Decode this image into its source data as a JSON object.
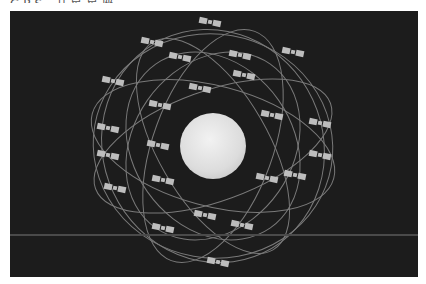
{
  "header": {
    "text": "GPS 卫星星座"
  },
  "scene": {
    "description": "GPS satellite constellation orbiting Earth",
    "background_color": "#1c1c1c",
    "orbit_color": "#8a8a8a",
    "satellite_color": "#bdbdbd",
    "globe": {
      "cx": 203,
      "cy": 135,
      "r": 33
    },
    "satellites": [
      [
        200,
        11
      ],
      [
        142,
        31
      ],
      [
        170,
        46
      ],
      [
        230,
        44
      ],
      [
        283,
        41
      ],
      [
        234,
        64
      ],
      [
        103,
        70
      ],
      [
        190,
        77
      ],
      [
        150,
        94
      ],
      [
        262,
        104
      ],
      [
        310,
        112
      ],
      [
        98,
        117
      ],
      [
        148,
        134
      ],
      [
        310,
        144
      ],
      [
        98,
        144
      ],
      [
        285,
        164
      ],
      [
        257,
        167
      ],
      [
        153,
        169
      ],
      [
        105,
        177
      ],
      [
        195,
        204
      ],
      [
        232,
        214
      ],
      [
        153,
        217
      ],
      [
        208,
        251
      ]
    ]
  }
}
